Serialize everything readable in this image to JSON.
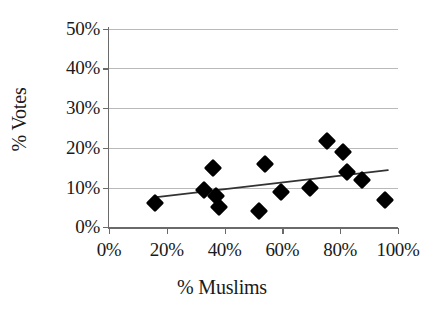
{
  "chart_data": {
    "type": "scatter",
    "title": "",
    "xlabel": "% Muslims",
    "ylabel": "% Votes",
    "xlim": [
      0,
      100
    ],
    "ylim": [
      0,
      50
    ],
    "xticks": [
      "0%",
      "20%",
      "40%",
      "60%",
      "80%",
      "100%"
    ],
    "xtick_values": [
      0,
      20,
      40,
      60,
      80,
      100
    ],
    "yticks": [
      "0%",
      "10%",
      "20%",
      "30%",
      "40%",
      "50%"
    ],
    "ytick_values": [
      0,
      10,
      20,
      30,
      40,
      50
    ],
    "grid": "horizontal",
    "legend": "none",
    "marker_style": "filled-diamond",
    "marker_color": "#000000",
    "gridline_color": "#b9b9b9",
    "axis_color": "#6a6a6a",
    "trendline_color": "#333333",
    "series": [
      {
        "name": "Constituencies",
        "points": [
          {
            "x": 16,
            "y": 6
          },
          {
            "x": 33,
            "y": 9.3
          },
          {
            "x": 36,
            "y": 15
          },
          {
            "x": 37,
            "y": 8
          },
          {
            "x": 38,
            "y": 5
          },
          {
            "x": 52,
            "y": 4
          },
          {
            "x": 54,
            "y": 16
          },
          {
            "x": 59.5,
            "y": 9
          },
          {
            "x": 69.5,
            "y": 9.8
          },
          {
            "x": 75.5,
            "y": 21.8
          },
          {
            "x": 81,
            "y": 19
          },
          {
            "x": 82.5,
            "y": 14
          },
          {
            "x": 87.5,
            "y": 11.8
          },
          {
            "x": 95.5,
            "y": 6.8
          }
        ]
      }
    ],
    "trendline": {
      "name": "Linear fit",
      "x_start": 16.5,
      "y_start": 7.6,
      "x_end": 96.5,
      "y_end": 14.4
    }
  }
}
